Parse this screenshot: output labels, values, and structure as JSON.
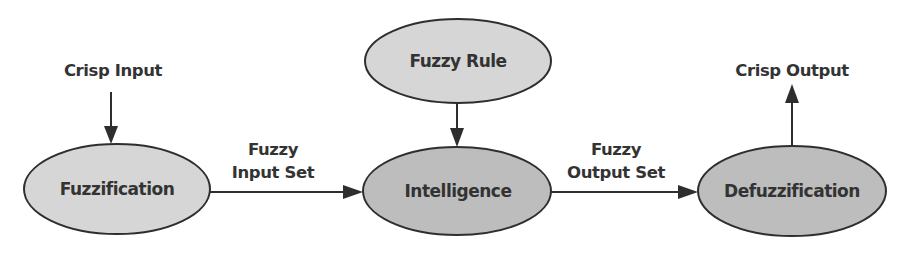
{
  "diagram": {
    "colors": {
      "stroke": "#2e2e2e",
      "text": "#333333",
      "fill_light": "#d6d6d6",
      "fill_dark": "#bdbdbd",
      "background": "#ffffff"
    },
    "nodes": {
      "fuzzification": {
        "label": "Fuzzification"
      },
      "intelligence": {
        "label": "Intelligence"
      },
      "defuzzification": {
        "label": "Defuzzification"
      },
      "fuzzy_rule": {
        "label": "Fuzzy Rule"
      }
    },
    "terminals": {
      "crisp_input": {
        "label": "Crisp Input"
      },
      "crisp_output": {
        "label": "Crisp Output"
      }
    },
    "edges": {
      "fuzzy_input_set": {
        "line1": "Fuzzy",
        "line2": "Input Set"
      },
      "fuzzy_output_set": {
        "line1": "Fuzzy",
        "line2": "Output Set"
      }
    }
  }
}
